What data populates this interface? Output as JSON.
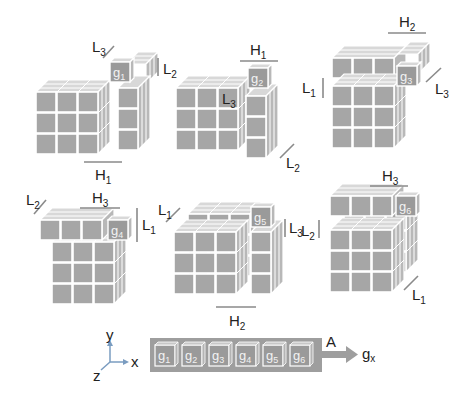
{
  "figure": {
    "colors": {
      "cube_face": "#a6a6a6",
      "cube_top": "#d8d8d8",
      "cube_side": "#b8b8b8",
      "grid_line": "#ffffff",
      "label": "#222222",
      "dimension_line": "#8a8a8a",
      "bar": "#9e9e9e"
    }
  },
  "panels": [
    {
      "id": "p1",
      "block": {
        "g": "g",
        "sub": "1"
      },
      "labels": [
        {
          "t": "L",
          "s": "3"
        },
        {
          "t": "L",
          "s": "2"
        },
        {
          "t": "H",
          "s": "1"
        }
      ]
    },
    {
      "id": "p2",
      "block": {
        "g": "g",
        "sub": "2"
      },
      "labels": [
        {
          "t": "H",
          "s": "1"
        },
        {
          "t": "L",
          "s": "3"
        },
        {
          "t": "L",
          "s": "2"
        }
      ]
    },
    {
      "id": "p3",
      "block": {
        "g": "g",
        "sub": "3"
      },
      "labels": [
        {
          "t": "H",
          "s": "2"
        },
        {
          "t": "L",
          "s": "1"
        },
        {
          "t": "L",
          "s": "3"
        }
      ]
    },
    {
      "id": "p4",
      "block": {
        "g": "g",
        "sub": "4"
      },
      "labels": [
        {
          "t": "L",
          "s": "2"
        },
        {
          "t": "H",
          "s": "3"
        },
        {
          "t": "L",
          "s": "1"
        }
      ]
    },
    {
      "id": "p5",
      "block": {
        "g": "g",
        "sub": "5"
      },
      "labels": [
        {
          "t": "L",
          "s": "1"
        },
        {
          "t": "L",
          "s": "3"
        },
        {
          "t": "H",
          "s": "2"
        }
      ]
    },
    {
      "id": "p6",
      "block": {
        "g": "g",
        "sub": "6"
      },
      "labels": [
        {
          "t": "H",
          "s": "3"
        },
        {
          "t": "L",
          "s": "2"
        },
        {
          "t": "L",
          "s": "1"
        }
      ]
    }
  ],
  "axes": {
    "y": "y",
    "x": "x",
    "z": "z"
  },
  "bar": {
    "blocks": [
      {
        "g": "g",
        "s": "1"
      },
      {
        "g": "g",
        "s": "2"
      },
      {
        "g": "g",
        "s": "3"
      },
      {
        "g": "g",
        "s": "4"
      },
      {
        "g": "g",
        "s": "5"
      },
      {
        "g": "g",
        "s": "6"
      }
    ],
    "arrow_label": "A",
    "result": {
      "g": "g",
      "s": "x"
    }
  }
}
